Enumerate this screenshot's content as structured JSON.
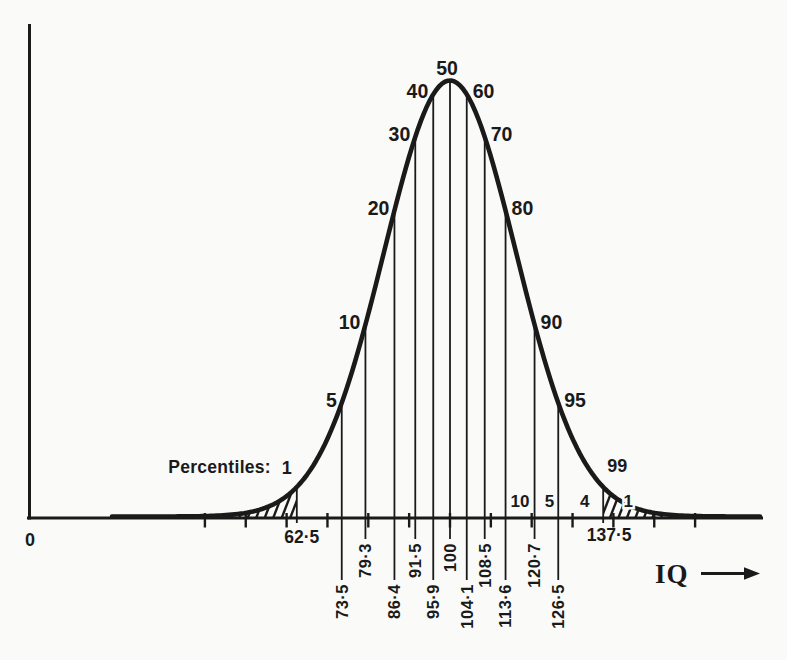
{
  "figure": {
    "background": "#fafaf8",
    "ink": "#1a1a1a"
  },
  "chart_data": {
    "type": "line",
    "curve": "normal-distribution",
    "mean_iq": 100,
    "sd_iq": 16,
    "xlabel": "IQ",
    "x_axis": {
      "origin_label": "0",
      "tick_start": 40,
      "tick_end": 160,
      "tick_step": 10
    },
    "percentiles": [
      {
        "p": 1,
        "iq": 62.5,
        "iq_label": "62·5",
        "p_label": "1"
      },
      {
        "p": 5,
        "iq": 73.5,
        "iq_label": "73·5",
        "p_label": "5"
      },
      {
        "p": 10,
        "iq": 79.3,
        "iq_label": "79·3",
        "p_label": "10"
      },
      {
        "p": 20,
        "iq": 86.4,
        "iq_label": "86·4",
        "p_label": "20"
      },
      {
        "p": 30,
        "iq": 91.5,
        "iq_label": "91·5",
        "p_label": "30"
      },
      {
        "p": 40,
        "iq": 95.9,
        "iq_label": "95·9",
        "p_label": "40"
      },
      {
        "p": 50,
        "iq": 100,
        "iq_label": "100",
        "p_label": "50"
      },
      {
        "p": 60,
        "iq": 104.1,
        "iq_label": "104·1",
        "p_label": "60"
      },
      {
        "p": 70,
        "iq": 108.5,
        "iq_label": "108·5",
        "p_label": "70"
      },
      {
        "p": 80,
        "iq": 113.6,
        "iq_label": "113·6",
        "p_label": "80"
      },
      {
        "p": 90,
        "iq": 120.7,
        "iq_label": "120·7",
        "p_label": "90"
      },
      {
        "p": 95,
        "iq": 126.5,
        "iq_label": "126·5",
        "p_label": "95"
      },
      {
        "p": 99,
        "iq": 137.5,
        "iq_label": "137·5",
        "p_label": "99"
      }
    ],
    "tail_area_labels": [
      "10",
      "5",
      "4",
      "1"
    ],
    "shaded_tails": [
      "below 1st percentile",
      "above 99th percentile"
    ],
    "annotations": {
      "percentiles_caption": "Percentiles:",
      "x_arrow_label": "IQ"
    }
  }
}
